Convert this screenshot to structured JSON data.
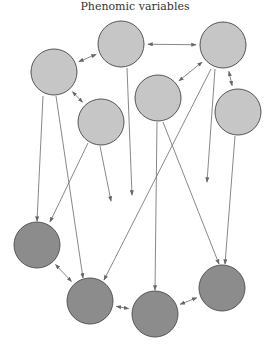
{
  "title": "Phenomic variables",
  "colors": {
    "phenomic_fill": "#c6c6c6",
    "latent_fill": "#8c8c8c",
    "stroke": "#555555",
    "edge": "#7a7a7a",
    "background": "#ffffff"
  },
  "nodes": [
    {
      "id": "p1",
      "kind": "phenomic",
      "cx": 54,
      "cy": 72,
      "r": 23
    },
    {
      "id": "p2",
      "kind": "phenomic",
      "cx": 121,
      "cy": 44,
      "r": 23
    },
    {
      "id": "p3",
      "kind": "phenomic",
      "cx": 223,
      "cy": 45,
      "r": 23
    },
    {
      "id": "p4",
      "kind": "phenomic",
      "cx": 158,
      "cy": 98,
      "r": 23
    },
    {
      "id": "p5",
      "kind": "phenomic",
      "cx": 238,
      "cy": 112,
      "r": 23
    },
    {
      "id": "p6",
      "kind": "phenomic",
      "cx": 101,
      "cy": 122,
      "r": 23
    },
    {
      "id": "l1",
      "kind": "latent",
      "cx": 37,
      "cy": 245,
      "r": 23
    },
    {
      "id": "l2",
      "kind": "latent",
      "cx": 90,
      "cy": 301,
      "r": 23
    },
    {
      "id": "l3",
      "kind": "latent",
      "cx": 155,
      "cy": 314,
      "r": 23
    },
    {
      "id": "l4",
      "kind": "latent",
      "cx": 222,
      "cy": 288,
      "r": 23
    }
  ],
  "bidirectional_edges": [
    {
      "from": "p1",
      "to": "p2"
    },
    {
      "from": "p2",
      "to": "p3"
    },
    {
      "from": "p3",
      "to": "p4"
    },
    {
      "from": "p3",
      "to": "p5"
    },
    {
      "from": "p1",
      "to": "p6"
    },
    {
      "from": "l1",
      "to": "l2"
    },
    {
      "from": "l2",
      "to": "l3"
    },
    {
      "from": "l3",
      "to": "l4"
    }
  ],
  "directed_edges": [
    {
      "x1": 43,
      "y1": 96,
      "x2": 37,
      "y2": 221
    },
    {
      "x1": 56,
      "y1": 96,
      "x2": 83,
      "y2": 278
    },
    {
      "x1": 88,
      "y1": 143,
      "x2": 50,
      "y2": 222
    },
    {
      "x1": 100,
      "y1": 146,
      "x2": 111,
      "y2": 201
    },
    {
      "x1": 127,
      "y1": 68,
      "x2": 132,
      "y2": 195
    },
    {
      "x1": 211,
      "y1": 69,
      "x2": 104,
      "y2": 280
    },
    {
      "x1": 215,
      "y1": 69,
      "x2": 207,
      "y2": 182
    },
    {
      "x1": 157,
      "y1": 122,
      "x2": 155,
      "y2": 290
    },
    {
      "x1": 163,
      "y1": 122,
      "x2": 219,
      "y2": 264
    },
    {
      "x1": 235,
      "y1": 136,
      "x2": 225,
      "y2": 264
    }
  ]
}
